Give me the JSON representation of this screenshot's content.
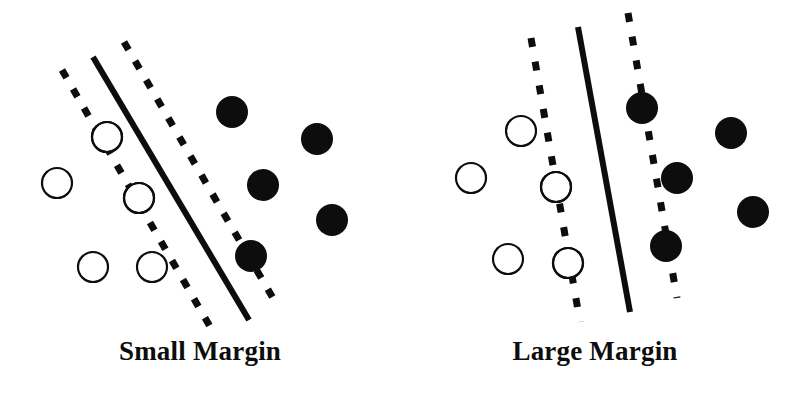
{
  "figure": {
    "background_color": "#ffffff",
    "ink_color": "#0d0d0d",
    "width": 795,
    "height": 403
  },
  "legend_semantics": {
    "open_circle": "negative class point",
    "filled_circle": "positive class point",
    "circled_point": "support vector",
    "solid_line": "decision boundary",
    "dashed_line": "margin boundary"
  },
  "panels": [
    {
      "id": "small-margin",
      "caption": "Small Margin",
      "chart_data": {
        "type": "scatter",
        "title": "Small Margin",
        "xlabel": "",
        "ylabel": "",
        "xlim": [
          0,
          400
        ],
        "ylim": [
          0,
          345
        ],
        "grid": false,
        "legend": "none",
        "lines": [
          {
            "name": "margin-lower",
            "style": "dashed",
            "x1": 62,
            "y1": 70,
            "x2": 212,
            "y2": 330,
            "stroke_width": 7,
            "dash": "9 13"
          },
          {
            "name": "decision-boundary",
            "style": "solid",
            "x1": 93,
            "y1": 57,
            "x2": 249,
            "y2": 320,
            "stroke_width": 6
          },
          {
            "name": "margin-upper",
            "style": "dashed",
            "x1": 124,
            "y1": 42,
            "x2": 277,
            "y2": 305,
            "stroke_width": 7,
            "dash": "9 13"
          }
        ],
        "series": [
          {
            "name": "negative class",
            "marker": "open-circle",
            "radius": 15,
            "points": [
              {
                "x": 57,
                "y": 183,
                "support_vector": false
              },
              {
                "x": 93,
                "y": 267,
                "support_vector": false
              },
              {
                "x": 152,
                "y": 267,
                "support_vector": false
              },
              {
                "x": 107,
                "y": 137,
                "support_vector": true
              },
              {
                "x": 139,
                "y": 198,
                "support_vector": true
              }
            ]
          },
          {
            "name": "positive class",
            "marker": "filled-circle",
            "radius": 16,
            "points": [
              {
                "x": 232,
                "y": 112,
                "support_vector": false
              },
              {
                "x": 317,
                "y": 139,
                "support_vector": false
              },
              {
                "x": 263,
                "y": 185,
                "support_vector": false
              },
              {
                "x": 332,
                "y": 220,
                "support_vector": false
              },
              {
                "x": 251,
                "y": 256,
                "support_vector": true
              }
            ]
          }
        ]
      }
    },
    {
      "id": "large-margin",
      "caption": "Large Margin",
      "chart_data": {
        "type": "scatter",
        "title": "Large Margin",
        "xlabel": "",
        "ylabel": "",
        "xlim": [
          0,
          400
        ],
        "ylim": [
          0,
          345
        ],
        "grid": false,
        "legend": "none",
        "lines": [
          {
            "name": "margin-lower",
            "style": "dashed",
            "x1": 136,
            "y1": 38,
            "x2": 185,
            "y2": 322,
            "stroke_width": 7,
            "dash": "9 15"
          },
          {
            "name": "decision-boundary",
            "style": "solid",
            "x1": 183,
            "y1": 27,
            "x2": 235,
            "y2": 312,
            "stroke_width": 6
          },
          {
            "name": "margin-upper",
            "style": "dashed",
            "x1": 233,
            "y1": 13,
            "x2": 282,
            "y2": 298,
            "stroke_width": 7,
            "dash": "9 15"
          }
        ],
        "series": [
          {
            "name": "negative class",
            "marker": "open-circle",
            "radius": 15,
            "points": [
              {
                "x": 126,
                "y": 131,
                "support_vector": false
              },
              {
                "x": 76,
                "y": 178,
                "support_vector": false
              },
              {
                "x": 113,
                "y": 259,
                "support_vector": false
              },
              {
                "x": 161,
                "y": 187,
                "support_vector": true
              },
              {
                "x": 173,
                "y": 263,
                "support_vector": true
              }
            ]
          },
          {
            "name": "positive class",
            "marker": "filled-circle",
            "radius": 16,
            "points": [
              {
                "x": 336,
                "y": 133,
                "support_vector": false
              },
              {
                "x": 358,
                "y": 212,
                "support_vector": false
              },
              {
                "x": 282,
                "y": 178,
                "support_vector": false
              },
              {
                "x": 247,
                "y": 108,
                "support_vector": true
              },
              {
                "x": 271,
                "y": 246,
                "support_vector": true
              }
            ]
          }
        ]
      }
    }
  ]
}
